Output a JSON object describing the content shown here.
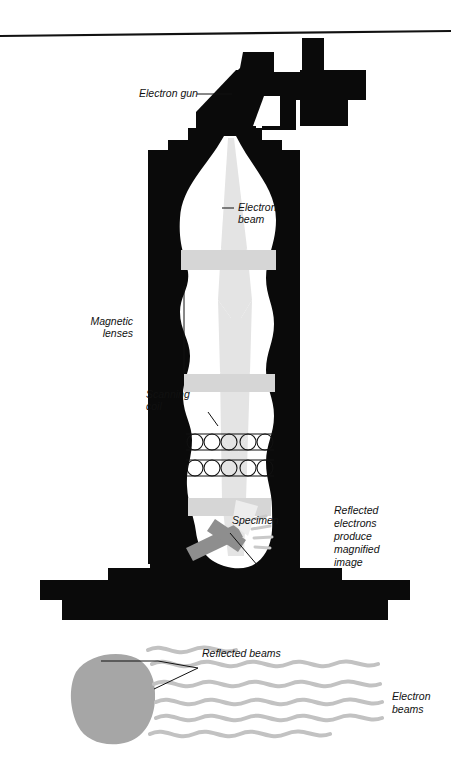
{
  "figure": {
    "rule_line": "top-horizontal-rule"
  },
  "labels": {
    "electron_gun": "Electron gun",
    "electron_beam_line1": "Electron",
    "electron_beam_line2": "beam",
    "magnetic_lenses_line1": "Magnetic",
    "magnetic_lenses_line2": "lenses",
    "scanning_coil_line1": "Scanning",
    "scanning_coil_line2": "coil",
    "specimen": "Specimen",
    "reflected_note_line1": "Reflected",
    "reflected_note_line2": "electrons",
    "reflected_note_line3": "produce",
    "reflected_note_line4": "magnified",
    "reflected_note_line5": "image",
    "reflected_beams": "Reflected beams",
    "electron_beams_line1": "Electron",
    "electron_beams_line2": "beams"
  },
  "colors": {
    "body_black": "#0a0a0a",
    "page_white": "#ffffff",
    "beam_gray": "#e2e2e2",
    "lens_band_gray": "#d8d8d8",
    "specimen_gray": "#8e8e8e",
    "blob_gray": "#a6a6a6",
    "wave_gray": "#bdbdbd",
    "text_black": "#111111"
  },
  "parts": {
    "gun": "electron-gun-silhouette",
    "column": "microscope-column",
    "lens_count": 3,
    "coil_rows": 2,
    "coils_per_row": 6,
    "stage": "specimen-stage",
    "base": "stepped-base-platform",
    "blob": "specimen-blob",
    "wave_count": 6
  }
}
